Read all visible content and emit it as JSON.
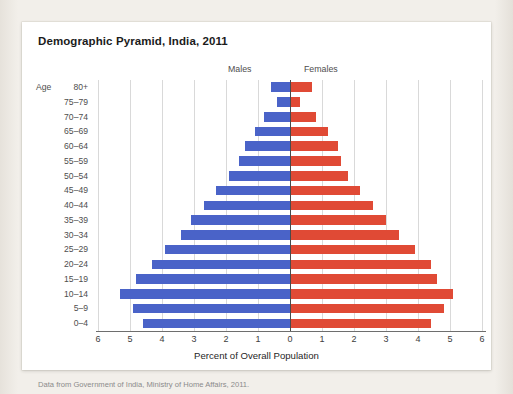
{
  "chart_data": {
    "type": "bar",
    "subtype": "population-pyramid",
    "title": "Demographic Pyramid, India, 2011",
    "xlabel": "Percent of Overall Population",
    "ylabel": "Age",
    "xlim": [
      -6,
      6
    ],
    "xticks": [
      "6",
      "5",
      "4",
      "3",
      "2",
      "1",
      "0",
      "1",
      "2",
      "3",
      "4",
      "5",
      "6"
    ],
    "xtick_values": [
      -6,
      -5,
      -4,
      -3,
      -2,
      -1,
      0,
      1,
      2,
      3,
      4,
      5,
      6
    ],
    "grid": true,
    "legend_position": "top-center",
    "categories": [
      "80+",
      "75–79",
      "70–74",
      "65–69",
      "60–64",
      "55–59",
      "50–54",
      "45–49",
      "40–44",
      "35–39",
      "30–34",
      "25–29",
      "20–24",
      "15–19",
      "10–14",
      "5–9",
      "0–4"
    ],
    "series": [
      {
        "name": "Males",
        "color": "#4a63c8",
        "values": [
          0.6,
          0.4,
          0.8,
          1.1,
          1.4,
          1.6,
          1.9,
          2.3,
          2.7,
          3.1,
          3.4,
          3.9,
          4.3,
          4.8,
          5.3,
          4.9,
          4.6
        ]
      },
      {
        "name": "Females",
        "color": "#e04a35",
        "values": [
          0.7,
          0.3,
          0.8,
          1.2,
          1.5,
          1.6,
          1.8,
          2.2,
          2.6,
          3.0,
          3.4,
          3.9,
          4.4,
          4.6,
          5.1,
          4.8,
          4.4
        ]
      }
    ],
    "source_note": "Data from Government of India, Ministry of Home Affairs, 2011."
  },
  "legend": {
    "males_label": "Males",
    "females_label": "Females"
  }
}
